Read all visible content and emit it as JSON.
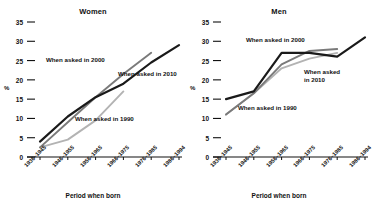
{
  "chart_data": [
    {
      "type": "line",
      "title": "Women",
      "xlabel": "Period when born",
      "ylabel": "%",
      "ylim": [
        0,
        35
      ],
      "yticks": [
        0,
        5,
        10,
        15,
        20,
        25,
        30,
        35
      ],
      "grid": false,
      "legend_position": "inline-annotations",
      "categories": [
        "1936–1945",
        "1946–1955",
        "1956–1965",
        "1966–1975",
        "1976–1985",
        "1986–1994"
      ],
      "series": [
        {
          "name": "When asked in 1990",
          "color": "#b3b3b3",
          "values": [
            2.5,
            4.5,
            9.5,
            17.0,
            null,
            null
          ]
        },
        {
          "name": "When asked in 2000",
          "color": "#7a7a7a",
          "values": [
            2.5,
            9.0,
            15.5,
            21.5,
            27.0,
            null
          ]
        },
        {
          "name": "When asked in 2010",
          "color": "#1a1a1a",
          "values": [
            4.0,
            10.5,
            15.5,
            19.0,
            24.5,
            29.0
          ]
        }
      ],
      "annotations": [
        {
          "text": "When asked in 2000",
          "x": 46,
          "y": 56
        },
        {
          "text": "When asked in 2010",
          "x": 118,
          "y": 70
        },
        {
          "text": "When asked in 1990",
          "x": 75,
          "y": 115
        }
      ]
    },
    {
      "type": "line",
      "title": "Men",
      "xlabel": "Period when born",
      "ylabel": "%",
      "ylim": [
        0,
        35
      ],
      "yticks": [
        0,
        5,
        10,
        15,
        20,
        25,
        30,
        35
      ],
      "grid": false,
      "legend_position": "inline-annotations",
      "categories": [
        "1936–1945",
        "1946–1955",
        "1956–1965",
        "1966–1975",
        "1976–1985",
        "1986–1994"
      ],
      "series": [
        {
          "name": "When asked in 1990",
          "color": "#b3b3b3",
          "values": [
            11.0,
            16.5,
            23.0,
            25.5,
            27.0,
            null
          ]
        },
        {
          "name": "When asked in 2000",
          "color": "#7a7a7a",
          "values": [
            11.0,
            16.5,
            24.0,
            27.5,
            28.0,
            null
          ]
        },
        {
          "name": "When asked in 2010",
          "color": "#1a1a1a",
          "values": [
            15.0,
            17.0,
            27.0,
            27.0,
            26.0,
            31.0
          ]
        }
      ],
      "annotations": [
        {
          "text": "When asked in 2000",
          "x": 60,
          "y": 36
        },
        {
          "text": "When asked",
          "x": 118,
          "y": 68
        },
        {
          "text": "in 2010",
          "x": 118,
          "y": 76
        },
        {
          "text": "When asked in 1990",
          "x": 52,
          "y": 104
        }
      ]
    }
  ]
}
